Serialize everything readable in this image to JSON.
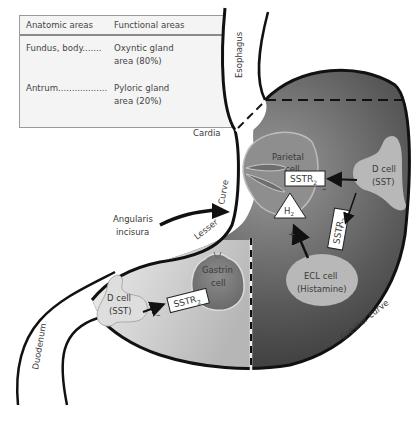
{
  "legend": {
    "headers": [
      "Anatomic areas",
      "Functional areas"
    ],
    "rows": [
      {
        "anatomic": "Fundus, body.......",
        "functional_line1": "Oxyntic gland",
        "functional_line2": "area (80%)"
      },
      {
        "anatomic": "Antrum..................",
        "functional_line1": "Pyloric gland",
        "functional_line2": "area (20%)"
      }
    ]
  },
  "labels": {
    "esophagus": "Esophagus",
    "cardia": "Cardia",
    "curve": "Curve",
    "lesser": "Lesser",
    "angularis_line1": "Angularis",
    "angularis_line2": "incisura",
    "greater_curve": "Greater curve",
    "duodenum": "Duodenum"
  },
  "cells": {
    "parietal_line1": "Parietal",
    "parietal_line2": "cell",
    "d_cell_fundus_line1": "D cell",
    "d_cell_fundus_line2": "(SST)",
    "ecl_line1": "ECL cell",
    "ecl_line2": "(Histamine)",
    "gastrin_line1": "Gastrin",
    "gastrin_line2": "cell",
    "d_cell_antrum_line1": "D cell",
    "d_cell_antrum_line2": "(SST)"
  },
  "receptors": {
    "sstr_base": "SSTR",
    "sstr_sub": "2",
    "h2_base": "H",
    "h2_sub": "2"
  },
  "signs": {
    "minus": "–",
    "plus": "+"
  },
  "colors": {
    "outline": "#111111",
    "corpus_dark": "#3a3a3a",
    "corpus_light": "#8a8a8a",
    "antrum_light": "#d8d8d8",
    "cell_fill": "#b8b8b8",
    "legend_bg": "#f4f4f4"
  }
}
